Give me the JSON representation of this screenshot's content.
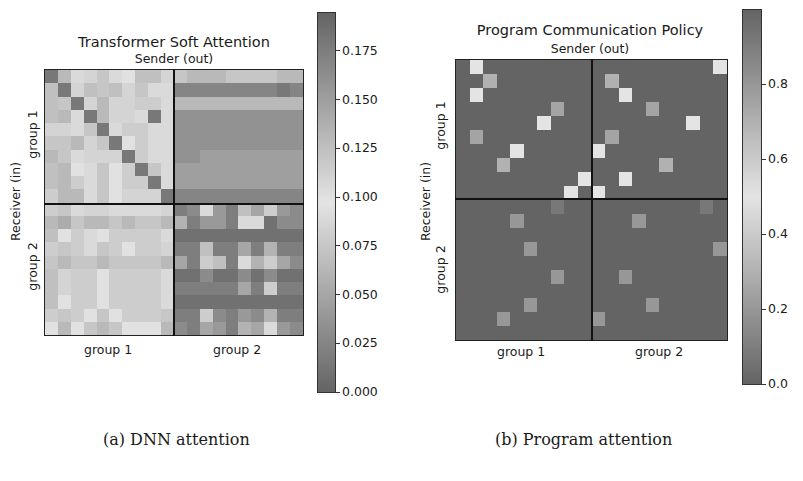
{
  "chart_data": [
    {
      "type": "heatmap",
      "title": "Transformer Soft Attention",
      "xlabel": "Sender (out)",
      "ylabel": "Receiver (in)",
      "x_group_labels": [
        "group 1",
        "group 2"
      ],
      "y_group_labels": [
        "group 1",
        "group 2"
      ],
      "size": [
        20,
        20
      ],
      "colorbar": {
        "min": 0.0,
        "max": 0.195,
        "ticks": [
          "0.000",
          "0.025",
          "0.050",
          "0.075",
          "0.100",
          "0.125",
          "0.150",
          "0.175"
        ]
      },
      "values": [
        [
          0.18,
          0.13,
          0.09,
          0.11,
          0.12,
          0.09,
          0.1,
          0.07,
          0.07,
          0.11,
          0.12,
          0.13,
          0.13,
          0.13,
          0.12,
          0.12,
          0.12,
          0.12,
          0.13,
          0.13
        ],
        [
          0.07,
          0.18,
          0.11,
          0.07,
          0.12,
          0.07,
          0.11,
          0.12,
          0.09,
          0.09,
          0.17,
          0.17,
          0.17,
          0.17,
          0.17,
          0.17,
          0.17,
          0.17,
          0.18,
          0.17
        ],
        [
          0.07,
          0.12,
          0.18,
          0.11,
          0.13,
          0.11,
          0.11,
          0.08,
          0.08,
          0.09,
          0.13,
          0.13,
          0.13,
          0.13,
          0.13,
          0.13,
          0.13,
          0.13,
          0.13,
          0.13
        ],
        [
          0.07,
          0.13,
          0.09,
          0.18,
          0.13,
          0.11,
          0.11,
          0.09,
          0.18,
          0.09,
          0.16,
          0.16,
          0.16,
          0.16,
          0.16,
          0.16,
          0.16,
          0.16,
          0.16,
          0.16
        ],
        [
          0.11,
          0.11,
          0.09,
          0.12,
          0.18,
          0.09,
          0.08,
          0.08,
          0.09,
          0.09,
          0.16,
          0.16,
          0.16,
          0.16,
          0.16,
          0.16,
          0.16,
          0.16,
          0.16,
          0.16
        ],
        [
          0.12,
          0.12,
          0.13,
          0.11,
          0.12,
          0.18,
          0.1,
          0.08,
          0.09,
          0.09,
          0.16,
          0.16,
          0.16,
          0.16,
          0.16,
          0.16,
          0.16,
          0.16,
          0.16,
          0.16
        ],
        [
          0.13,
          0.12,
          0.09,
          0.11,
          0.11,
          0.11,
          0.18,
          0.08,
          0.09,
          0.09,
          0.16,
          0.16,
          0.15,
          0.15,
          0.15,
          0.15,
          0.15,
          0.15,
          0.15,
          0.15
        ],
        [
          0.07,
          0.13,
          0.1,
          0.09,
          0.12,
          0.1,
          0.08,
          0.18,
          0.12,
          0.09,
          0.15,
          0.15,
          0.15,
          0.15,
          0.15,
          0.15,
          0.15,
          0.15,
          0.15,
          0.15
        ],
        [
          0.07,
          0.13,
          0.08,
          0.09,
          0.12,
          0.1,
          0.08,
          0.08,
          0.18,
          0.09,
          0.15,
          0.15,
          0.15,
          0.15,
          0.15,
          0.15,
          0.15,
          0.15,
          0.15,
          0.15
        ],
        [
          0.08,
          0.13,
          0.13,
          0.09,
          0.12,
          0.1,
          0.11,
          0.11,
          0.11,
          0.18,
          0.17,
          0.17,
          0.17,
          0.17,
          0.17,
          0.17,
          0.17,
          0.17,
          0.17,
          0.17
        ],
        [
          0.08,
          0.12,
          0.09,
          0.11,
          0.11,
          0.09,
          0.09,
          0.09,
          0.09,
          0.11,
          0.02,
          0.03,
          0.09,
          0.04,
          0.02,
          0.07,
          0.05,
          0.08,
          0.04,
          0.03
        ],
        [
          0.13,
          0.14,
          0.12,
          0.13,
          0.13,
          0.12,
          0.13,
          0.12,
          0.12,
          0.13,
          0.06,
          0.02,
          0.04,
          0.04,
          0.02,
          0.09,
          0.09,
          0.01,
          0.03,
          0.03
        ],
        [
          0.07,
          0.1,
          0.08,
          0.09,
          0.1,
          0.08,
          0.08,
          0.08,
          0.08,
          0.09,
          0.01,
          0.01,
          0.01,
          0.01,
          0.01,
          0.01,
          0.01,
          0.01,
          0.01,
          0.01
        ],
        [
          0.08,
          0.12,
          0.08,
          0.09,
          0.12,
          0.08,
          0.1,
          0.08,
          0.08,
          0.11,
          0.02,
          0.02,
          0.07,
          0.02,
          0.02,
          0.05,
          0.02,
          0.06,
          0.02,
          0.02
        ],
        [
          0.12,
          0.13,
          0.12,
          0.12,
          0.13,
          0.12,
          0.12,
          0.12,
          0.12,
          0.13,
          0.05,
          0.02,
          0.08,
          0.07,
          0.02,
          0.09,
          0.06,
          0.08,
          0.05,
          0.03
        ],
        [
          0.07,
          0.11,
          0.08,
          0.08,
          0.1,
          0.08,
          0.08,
          0.08,
          0.08,
          0.09,
          0.01,
          0.01,
          0.03,
          0.01,
          0.01,
          0.03,
          0.01,
          0.03,
          0.01,
          0.01
        ],
        [
          0.07,
          0.11,
          0.08,
          0.08,
          0.1,
          0.08,
          0.08,
          0.08,
          0.08,
          0.09,
          0.02,
          0.02,
          0.02,
          0.02,
          0.02,
          0.05,
          0.02,
          0.08,
          0.02,
          0.02
        ],
        [
          0.07,
          0.1,
          0.08,
          0.08,
          0.1,
          0.08,
          0.08,
          0.08,
          0.08,
          0.09,
          0.01,
          0.01,
          0.01,
          0.01,
          0.01,
          0.01,
          0.01,
          0.01,
          0.01,
          0.01
        ],
        [
          0.08,
          0.12,
          0.08,
          0.1,
          0.12,
          0.1,
          0.08,
          0.08,
          0.08,
          0.12,
          0.02,
          0.02,
          0.08,
          0.03,
          0.02,
          0.04,
          0.03,
          0.06,
          0.02,
          0.02
        ],
        [
          0.1,
          0.13,
          0.1,
          0.12,
          0.13,
          0.12,
          0.1,
          0.1,
          0.1,
          0.13,
          0.03,
          0.02,
          0.05,
          0.04,
          0.02,
          0.06,
          0.05,
          0.09,
          0.04,
          0.03
        ]
      ]
    },
    {
      "type": "heatmap",
      "title": "Program Communication Policy",
      "xlabel": "Sender (out)",
      "ylabel": "Receiver (in)",
      "x_group_labels": [
        "group 1",
        "group 2"
      ],
      "y_group_labels": [
        "group 1",
        "group 2"
      ],
      "size": [
        20,
        20
      ],
      "colorbar": {
        "min": 0.0,
        "max": 1.0,
        "ticks": [
          "0.0",
          "0.2",
          "0.4",
          "0.6",
          "0.8"
        ]
      },
      "background_value": 0.0,
      "nonzero_cells": [
        {
          "r": 0,
          "c": 1,
          "v": 0.5
        },
        {
          "r": 1,
          "c": 2,
          "v": 0.3
        },
        {
          "r": 2,
          "c": 1,
          "v": 0.5
        },
        {
          "r": 3,
          "c": 7,
          "v": 0.25
        },
        {
          "r": 4,
          "c": 6,
          "v": 0.5
        },
        {
          "r": 5,
          "c": 1,
          "v": 0.25
        },
        {
          "r": 6,
          "c": 4,
          "v": 0.5
        },
        {
          "r": 7,
          "c": 3,
          "v": 0.3
        },
        {
          "r": 8,
          "c": 9,
          "v": 0.5
        },
        {
          "r": 9,
          "c": 8,
          "v": 0.5
        },
        {
          "r": 0,
          "c": 19,
          "v": 0.5
        },
        {
          "r": 1,
          "c": 11,
          "v": 0.3
        },
        {
          "r": 2,
          "c": 12,
          "v": 0.5
        },
        {
          "r": 3,
          "c": 14,
          "v": 0.25
        },
        {
          "r": 4,
          "c": 17,
          "v": 0.5
        },
        {
          "r": 5,
          "c": 11,
          "v": 0.25
        },
        {
          "r": 6,
          "c": 10,
          "v": 0.5
        },
        {
          "r": 7,
          "c": 15,
          "v": 0.3
        },
        {
          "r": 8,
          "c": 12,
          "v": 0.5
        },
        {
          "r": 9,
          "c": 10,
          "v": 0.5
        },
        {
          "r": 10,
          "c": 7,
          "v": 0.08
        },
        {
          "r": 11,
          "c": 4,
          "v": 0.2
        },
        {
          "r": 13,
          "c": 5,
          "v": 0.2
        },
        {
          "r": 15,
          "c": 7,
          "v": 0.2
        },
        {
          "r": 17,
          "c": 5,
          "v": 0.2
        },
        {
          "r": 18,
          "c": 3,
          "v": 0.2
        },
        {
          "r": 10,
          "c": 18,
          "v": 0.08
        },
        {
          "r": 11,
          "c": 13,
          "v": 0.2
        },
        {
          "r": 13,
          "c": 19,
          "v": 0.2
        },
        {
          "r": 15,
          "c": 12,
          "v": 0.2
        },
        {
          "r": 17,
          "c": 14,
          "v": 0.2
        },
        {
          "r": 18,
          "c": 10,
          "v": 0.2
        }
      ]
    }
  ],
  "captions": {
    "a": "(a) DNN attention",
    "b": "(b) Program attention"
  }
}
